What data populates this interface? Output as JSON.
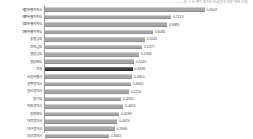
{
  "chart_data": {
    "type": "bar",
    "orientation": "horizontal",
    "title": "○○○○년 시·도별 지표지수 비교(전국 평균 대비 수준)",
    "xlabel": "",
    "ylabel": "",
    "xlim": [
      0,
      1.0
    ],
    "grid": false,
    "legend": "none",
    "highlight_category": "전국",
    "categories": [
      "세종특별자치시",
      "제주특별자치도",
      "강원특별자치도",
      "전북특별자치도",
      "충청남도",
      "전라남도",
      "경상남도",
      "경상북도",
      "전국",
      "서울특별시",
      "광주광역시",
      "울산광역시",
      "경기도",
      "인천광역시",
      "충청북도",
      "대전광역시",
      "대구광역시",
      "부산광역시"
    ],
    "values": [
      0.9007,
      0.7113,
      0.6895,
      0.6082,
      0.5631,
      0.5477,
      0.5308,
      0.5022,
      0.4938,
      0.491,
      0.4845,
      0.472,
      0.429,
      0.4415,
      0.4183,
      0.4076,
      0.394,
      0.3601
    ],
    "value_labels": [
      "0.9007",
      "0.7113",
      "0.6895",
      "0.6082",
      "0.5631",
      "0.5477",
      "0.5308",
      "0.5022",
      "0.4938",
      "0.4910",
      "0.4845",
      "0.4720",
      "0.4290",
      "0.4415",
      "0.4183",
      "0.4076",
      "0.3940",
      "0.3601"
    ],
    "colors": {
      "bar": "#a6a6a6",
      "highlight_bar": "#3f3f3f",
      "axis": "#9a9a9a",
      "label_text": "#3d3d3d",
      "value_text": "#4a4a4a",
      "title_text": "#8a8a8a",
      "background": "#ffffff"
    }
  }
}
